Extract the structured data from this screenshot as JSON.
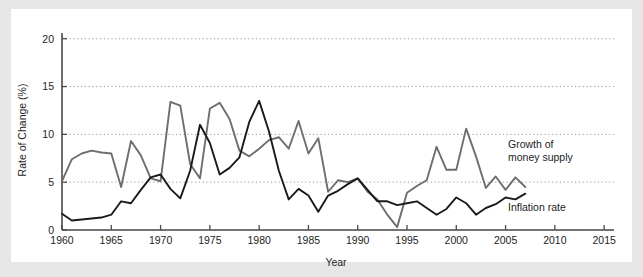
{
  "figure": {
    "background_color": "#e7e7e7",
    "card_color": "#ffffff"
  },
  "chart_data": {
    "type": "line",
    "title": "",
    "xlabel": "Year",
    "ylabel": "Rate of Change (%)",
    "xlim": [
      1960,
      2016
    ],
    "ylim": [
      0,
      20.6
    ],
    "xticks": [
      1960,
      1965,
      1970,
      1975,
      1980,
      1985,
      1990,
      1995,
      2000,
      2005,
      2010,
      2015
    ],
    "xtick_labels": [
      "1960",
      "1965",
      "1970",
      "1975",
      "1980",
      "1985",
      "1990",
      "1995",
      "2000",
      "2005",
      "2010",
      "2015"
    ],
    "yticks": [
      0,
      5,
      10,
      15,
      20
    ],
    "ytick_labels": [
      "0",
      "5",
      "10",
      "15",
      "20"
    ],
    "grid": "horizontal-dotted",
    "legend_position": "inline-annotations",
    "x": [
      1960,
      1961,
      1962,
      1963,
      1964,
      1965,
      1966,
      1967,
      1968,
      1969,
      1970,
      1971,
      1972,
      1973,
      1974,
      1975,
      1976,
      1977,
      1978,
      1979,
      1980,
      1981,
      1982,
      1983,
      1984,
      1985,
      1986,
      1987,
      1988,
      1989,
      1990,
      1991,
      1992,
      1993,
      1994,
      1995,
      1996,
      1997,
      1998,
      1999,
      2000,
      2001,
      2002,
      2003,
      2004,
      2005,
      2006,
      2007
    ],
    "series": [
      {
        "name": "Growth of money supply",
        "color": "#6e6e6e",
        "label_text": "Growth of\nmoney supply",
        "label_line1": "Growth of",
        "label_line2": "money supply",
        "values": [
          5.1,
          7.4,
          8.0,
          8.3,
          8.1,
          8.0,
          4.5,
          9.3,
          7.8,
          5.4,
          5.1,
          13.4,
          13.0,
          6.9,
          5.4,
          12.7,
          13.3,
          11.6,
          8.3,
          7.7,
          8.5,
          9.4,
          9.7,
          8.5,
          11.4,
          8.0,
          9.6,
          4.0,
          5.2,
          5.0,
          5.4,
          4.0,
          3.2,
          1.6,
          0.3,
          3.9,
          4.6,
          5.2,
          8.7,
          6.3,
          6.3,
          10.6,
          7.7,
          4.4,
          5.6,
          4.2,
          5.5,
          4.5
        ]
      },
      {
        "name": "Inflation rate",
        "color": "#1a1a1a",
        "label_text": "Inflation rate",
        "values": [
          1.7,
          1.0,
          1.1,
          1.2,
          1.3,
          1.6,
          3.0,
          2.8,
          4.2,
          5.5,
          5.8,
          4.3,
          3.3,
          6.2,
          11.0,
          9.1,
          5.8,
          6.5,
          7.6,
          11.3,
          13.5,
          10.3,
          6.2,
          3.2,
          4.3,
          3.6,
          1.9,
          3.6,
          4.1,
          4.8,
          5.4,
          4.2,
          3.0,
          3.0,
          2.6,
          2.8,
          3.0,
          2.3,
          1.6,
          2.2,
          3.4,
          2.8,
          1.6,
          2.3,
          2.7,
          3.4,
          3.2,
          3.8
        ]
      }
    ]
  }
}
